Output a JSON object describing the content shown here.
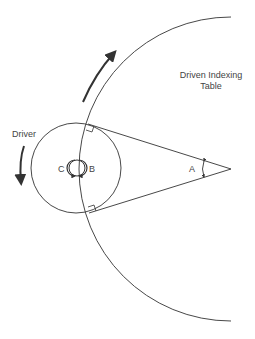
{
  "diagram": {
    "labels": {
      "driven_line1": "Driven Indexing",
      "driven_line2": "Table",
      "driver": "Driver",
      "angle_a": "A",
      "angle_b": "B",
      "angle_c": "C"
    },
    "colors": {
      "stroke": "#333333",
      "background": "#ffffff"
    },
    "elements": [
      "driver-circle",
      "driven-table-arc",
      "tangent-line-upper",
      "tangent-line-lower",
      "right-angle-marker-upper",
      "right-angle-marker-lower",
      "angle-a-arc",
      "angle-bc-circle",
      "rotation-arrow-driven",
      "rotation-arrow-driver"
    ]
  }
}
